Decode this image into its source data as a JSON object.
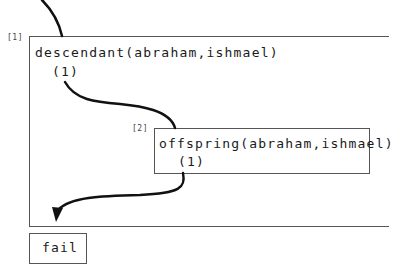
{
  "frames": [
    {
      "label": "[1]",
      "goal": "descendant(abraham,ishmael)",
      "clause": "(1)"
    },
    {
      "label": "[2]",
      "goal": "offspring(abraham,ishmael)",
      "clause": "(1)"
    }
  ],
  "result": "fail",
  "colors": {
    "line": "#111111",
    "border": "#555555"
  }
}
